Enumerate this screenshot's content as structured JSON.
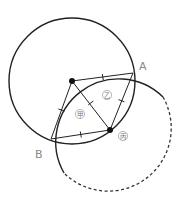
{
  "diagram": {
    "points": [
      {
        "id": "A",
        "label": "A"
      },
      {
        "id": "B",
        "label": "B"
      }
    ],
    "regions": [
      {
        "id": "jia",
        "label": "甲"
      },
      {
        "id": "yi",
        "label": "乙"
      },
      {
        "id": "bing",
        "label": "丙"
      }
    ],
    "colors": {
      "stroke": "#222222",
      "label": "#888888"
    }
  }
}
